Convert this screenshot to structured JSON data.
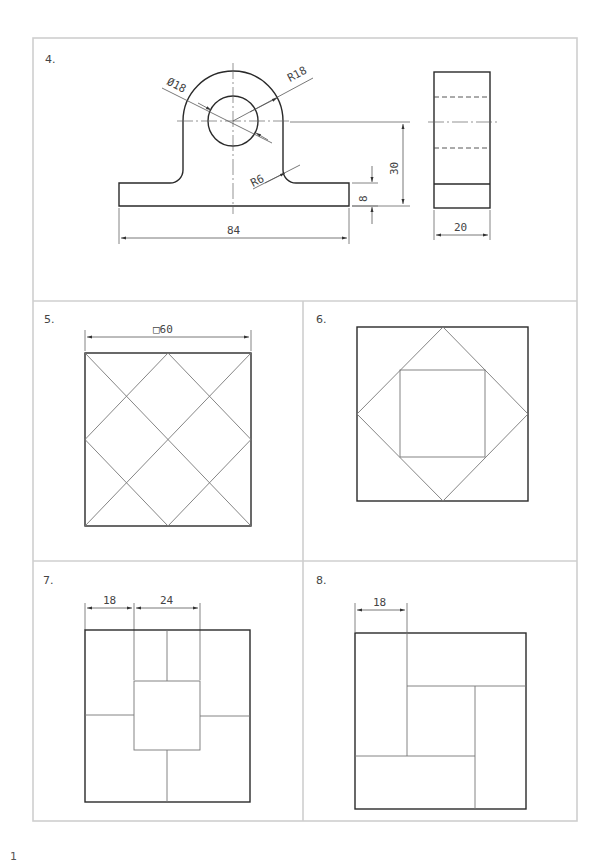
{
  "panels": [
    {
      "number": "4.",
      "dimensions": {
        "diameter": "Ø18",
        "outer_radius": "R18",
        "fillet_radius": "R6",
        "overall_width": "84",
        "base_height": "8",
        "center_height": "30",
        "side_width": "20"
      }
    },
    {
      "number": "5.",
      "dimensions": {
        "square_size": "□60"
      }
    },
    {
      "number": "6.",
      "dimensions": {}
    },
    {
      "number": "7.",
      "dimensions": {
        "left_offset": "18",
        "center_width": "24"
      }
    },
    {
      "number": "8.",
      "dimensions": {
        "left_offset": "18"
      }
    }
  ],
  "page_number": "1"
}
